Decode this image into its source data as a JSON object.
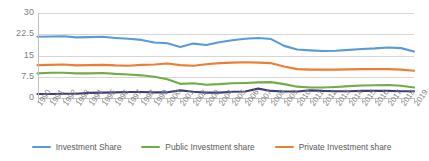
{
  "chart_data": {
    "type": "line",
    "title": "",
    "subtitle": "",
    "xlabel": "",
    "ylabel": "",
    "ylim": [
      0,
      30
    ],
    "yticks": [
      "0",
      "7.5",
      "15",
      "22.5",
      "30"
    ],
    "ytick_values": [
      0,
      7.5,
      15,
      22.5,
      30
    ],
    "grid": true,
    "legend_position": "bottom",
    "categories": [
      "1990",
      "1991",
      "1992",
      "1993",
      "1994",
      "1995",
      "1996",
      "1997",
      "1998",
      "1999",
      "2000",
      "2001",
      "2002",
      "2003",
      "2004",
      "2005",
      "2006",
      "2007",
      "2008",
      "2009",
      "2010",
      "2011",
      "2012",
      "2013",
      "2014",
      "2015",
      "2016",
      "2017",
      "2018",
      "2019"
    ],
    "series": [
      {
        "name": "Investment Share",
        "color": "#5B9BD5",
        "values": [
          21.6,
          21.7,
          21.8,
          21.4,
          21.5,
          21.6,
          21.2,
          20.9,
          20.5,
          19.6,
          19.3,
          18.0,
          19.2,
          18.7,
          19.7,
          20.4,
          20.9,
          21.2,
          20.8,
          18.4,
          17.1,
          16.8,
          16.6,
          16.7,
          17.0,
          17.3,
          17.5,
          17.8,
          17.6,
          16.4
        ]
      },
      {
        "name": "Public Investment share",
        "color": "#70AD47",
        "values": [
          8.7,
          8.9,
          8.9,
          8.7,
          8.7,
          8.8,
          8.5,
          8.3,
          8.0,
          7.5,
          6.6,
          5.0,
          5.2,
          4.7,
          4.9,
          5.2,
          5.3,
          5.5,
          5.6,
          4.9,
          4.0,
          3.7,
          3.7,
          3.9,
          4.2,
          4.4,
          4.5,
          4.6,
          4.3,
          3.7
        ]
      },
      {
        "name": "Private Investment share",
        "color": "#ED7D31",
        "values": [
          11.6,
          11.7,
          11.8,
          11.5,
          11.6,
          11.7,
          11.5,
          11.4,
          11.7,
          11.8,
          12.2,
          11.6,
          11.4,
          11.9,
          12.3,
          12.5,
          12.6,
          12.5,
          12.3,
          11.1,
          10.2,
          10.0,
          10.0,
          10.0,
          10.1,
          10.2,
          10.2,
          10.2,
          10.0,
          9.6
        ]
      },
      {
        "name": "",
        "color": "#3F3D76",
        "values": [
          1.4,
          1.4,
          1.5,
          1.5,
          1.8,
          1.9,
          2.0,
          2.1,
          2.1,
          2.0,
          2.0,
          2.7,
          2.2,
          1.9,
          1.9,
          2.2,
          2.3,
          3.3,
          2.5,
          2.3,
          2.3,
          2.7,
          2.5,
          2.4,
          2.4,
          2.5,
          2.5,
          2.5,
          2.4,
          2.4
        ]
      }
    ]
  },
  "legend": {
    "items": [
      {
        "label": "Investment Share",
        "color": "#5B9BD5"
      },
      {
        "label": "Public Investment share",
        "color": "#70AD47"
      },
      {
        "label": "Private Investment share",
        "color": "#ED7D31"
      }
    ]
  },
  "colors": {
    "grid": "#d6d6d6",
    "axis": "#bfbfbf",
    "tick_text": "#7f7f7f",
    "legend_text": "#595959",
    "background": "#ffffff"
  }
}
